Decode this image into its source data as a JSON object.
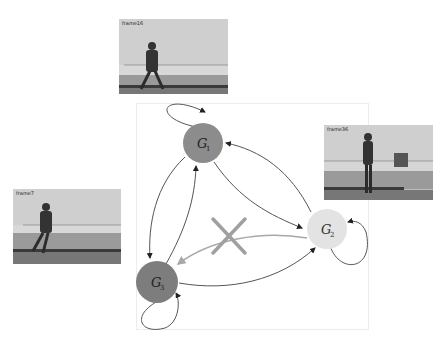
{
  "frames": [
    {
      "id": "frame16",
      "label": "frame16",
      "pose": "walking"
    },
    {
      "id": "frame36",
      "label": "frame36",
      "pose": "standing"
    },
    {
      "id": "frame7",
      "label": "frame7",
      "pose": "walking"
    }
  ],
  "graph": {
    "nodes": [
      {
        "id": "G1",
        "label": "G",
        "subscript": "1",
        "color": "#8c8c8c"
      },
      {
        "id": "G2",
        "label": "G",
        "subscript": "2",
        "color": "#e3e3e3"
      },
      {
        "id": "G3",
        "label": "G",
        "subscript": "3",
        "color": "#7d7d7d"
      }
    ],
    "edges": [
      {
        "from": "G1",
        "to": "G1",
        "type": "self-loop"
      },
      {
        "from": "G2",
        "to": "G2",
        "type": "self-loop"
      },
      {
        "from": "G3",
        "to": "G3",
        "type": "self-loop"
      },
      {
        "from": "G1",
        "to": "G2"
      },
      {
        "from": "G2",
        "to": "G1"
      },
      {
        "from": "G1",
        "to": "G3"
      },
      {
        "from": "G3",
        "to": "G1"
      },
      {
        "from": "G3",
        "to": "G2"
      },
      {
        "from": "G2",
        "to": "G3",
        "status": "forbidden",
        "marker": "cross"
      }
    ],
    "edge_color": "#555555",
    "forbidden_color": "#a8a8a8"
  }
}
